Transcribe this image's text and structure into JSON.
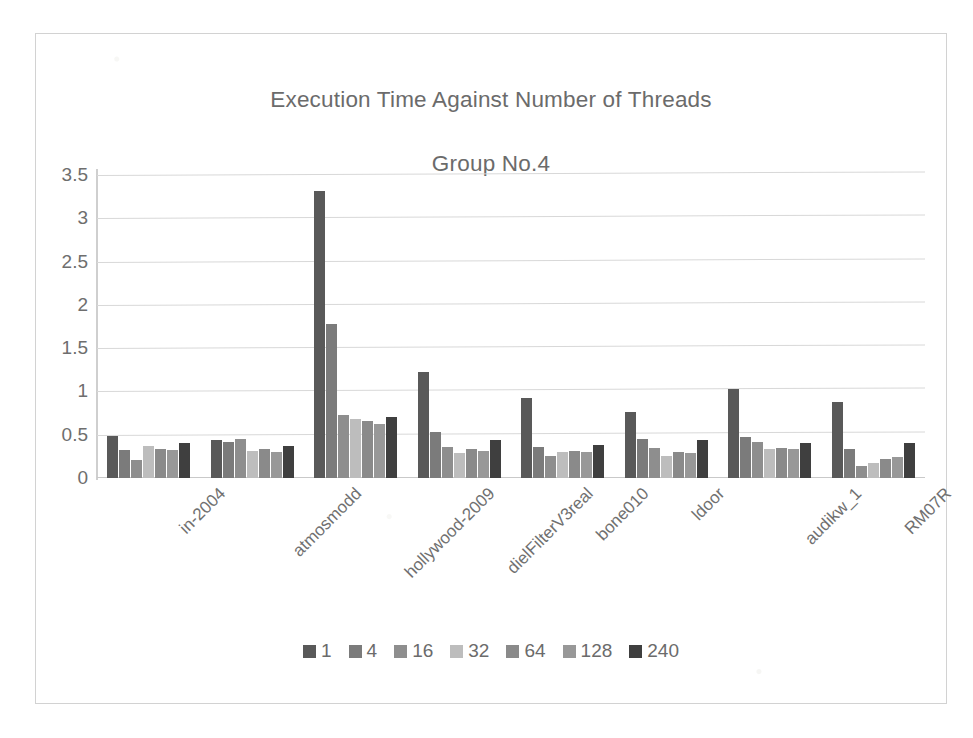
{
  "chart_data": {
    "type": "bar",
    "title": "Execution Time Against Number of Threads\nGroup No.4",
    "title_line1": "Execution Time Against Number of Threads",
    "title_line2": "Group No.4",
    "xlabel": "",
    "ylabel": "",
    "ylim": [
      0,
      3.5
    ],
    "ytick_labels": [
      "3.5",
      "3",
      "2.5",
      "2",
      "1.5",
      "1",
      "0.5",
      "0"
    ],
    "ytick_values": [
      3.5,
      3,
      2.5,
      2,
      1.5,
      1,
      0.5,
      0
    ],
    "grid": true,
    "legend_position": "bottom",
    "categories": [
      "in-2004",
      "atmosmodd",
      "hollywood-2009",
      "dielFilterV3real",
      "bone010",
      "ldoor",
      "audikw_1",
      "RM07R"
    ],
    "series": [
      {
        "name": "1",
        "color": "#595959",
        "values": [
          0.48,
          0.44,
          3.31,
          1.22,
          0.92,
          0.76,
          1.03,
          0.88
        ]
      },
      {
        "name": "4",
        "color": "#7b7b7b",
        "values": [
          0.32,
          0.42,
          1.78,
          0.53,
          0.36,
          0.45,
          0.47,
          0.34
        ]
      },
      {
        "name": "16",
        "color": "#8e8e8e",
        "values": [
          0.21,
          0.45,
          0.73,
          0.36,
          0.25,
          0.35,
          0.42,
          0.14
        ]
      },
      {
        "name": "32",
        "color": "#bdbdbd",
        "values": [
          0.37,
          0.31,
          0.68,
          0.29,
          0.3,
          0.26,
          0.33,
          0.17
        ]
      },
      {
        "name": "64",
        "color": "#8a8a8a",
        "values": [
          0.33,
          0.33,
          0.66,
          0.33,
          0.31,
          0.3,
          0.35,
          0.22
        ]
      },
      {
        "name": "128",
        "color": "#989898",
        "values": [
          0.32,
          0.3,
          0.62,
          0.31,
          0.3,
          0.29,
          0.33,
          0.24
        ]
      },
      {
        "name": "240",
        "color": "#3f3f3f",
        "values": [
          0.4,
          0.37,
          0.7,
          0.44,
          0.38,
          0.44,
          0.4,
          0.41
        ]
      }
    ]
  },
  "legend": {
    "entries": [
      "1",
      "4",
      "16",
      "32",
      "64",
      "128",
      "240"
    ]
  }
}
